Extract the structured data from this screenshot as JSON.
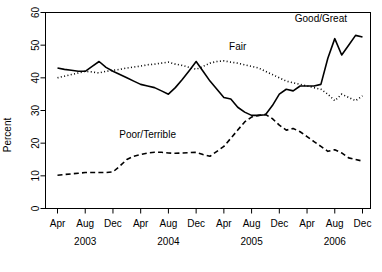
{
  "chart_data": {
    "type": "line",
    "title": "",
    "xlabel": "",
    "ylabel": "Percent",
    "ylim": [
      0,
      60
    ],
    "yticks": [
      0,
      10,
      20,
      30,
      40,
      50,
      60
    ],
    "ytick_labels": [
      "0",
      "10",
      "20",
      "30",
      "40",
      "50",
      "60"
    ],
    "grid": false,
    "legend_position": "inline-annotations",
    "x_tick_labels": [
      "Apr",
      "Aug",
      "Dec",
      "Apr",
      "Aug",
      "Dec",
      "Apr",
      "Aug",
      "Dec",
      "Apr",
      "Aug",
      "Dec"
    ],
    "x_year_labels": [
      "2003",
      "2004",
      "2005",
      "2006"
    ],
    "x_indices_of_ticks": [
      0,
      4,
      8,
      12,
      16,
      20,
      24,
      28,
      32,
      36,
      40,
      44
    ],
    "x": [
      "2003-04",
      "2003-05",
      "2003-06",
      "2003-07",
      "2003-08",
      "2003-09",
      "2003-10",
      "2003-11",
      "2003-12",
      "2004-01",
      "2004-02",
      "2004-03",
      "2004-04",
      "2004-05",
      "2004-06",
      "2004-07",
      "2004-08",
      "2004-09",
      "2004-10",
      "2004-11",
      "2004-12",
      "2005-01",
      "2005-02",
      "2005-03",
      "2005-04",
      "2005-05",
      "2005-06",
      "2005-07",
      "2005-08",
      "2005-09",
      "2005-10",
      "2005-11",
      "2005-12",
      "2006-01",
      "2006-02",
      "2006-03",
      "2006-04",
      "2006-05",
      "2006-06",
      "2006-07",
      "2006-08",
      "2006-09",
      "2006-10",
      "2006-11",
      "2006-12"
    ],
    "series": [
      {
        "name": "Good/Great",
        "style": "solid",
        "label": "Good/Great",
        "label_x_index": 38,
        "label_y_value": 57,
        "values": [
          43.0,
          42.6,
          42.3,
          42.0,
          42.0,
          43.5,
          45.0,
          43.2,
          42.0,
          41.0,
          40.0,
          39.0,
          38.0,
          37.5,
          37.0,
          36.0,
          35.0,
          37.0,
          39.5,
          42.2,
          45.0,
          42.0,
          39.0,
          36.5,
          34.0,
          33.5,
          31.0,
          29.5,
          28.5,
          28.5,
          28.7,
          31.5,
          35.0,
          36.5,
          36.0,
          37.5,
          37.5,
          37.5,
          38.0,
          46.0,
          52.0,
          47.0,
          50.0,
          53.0,
          52.5
        ]
      },
      {
        "name": "Fair",
        "style": "dotted",
        "label": "Fair",
        "label_x_index": 26,
        "label_y_value": 48.5,
        "values": [
          40.0,
          40.5,
          41.0,
          41.5,
          42.0,
          41.8,
          41.5,
          42.0,
          42.3,
          42.6,
          43.0,
          43.3,
          43.6,
          44.0,
          44.2,
          44.5,
          44.8,
          44.2,
          43.8,
          43.2,
          42.6,
          43.5,
          44.5,
          45.0,
          45.2,
          44.8,
          44.5,
          44.0,
          43.5,
          43.0,
          42.0,
          41.0,
          40.0,
          39.0,
          38.5,
          38.0,
          37.5,
          37.0,
          36.5,
          35.0,
          33.0,
          35.0,
          34.0,
          33.0,
          34.5
        ]
      },
      {
        "name": "Poor/Terrible",
        "style": "dashed",
        "label": "Poor/Terrible",
        "label_x_index": 13,
        "label_y_value": 21.5,
        "values": [
          10.2,
          10.4,
          10.6,
          10.8,
          11.0,
          11.0,
          11.0,
          11.0,
          11.2,
          13.0,
          15.0,
          16.0,
          16.5,
          17.0,
          17.2,
          17.2,
          17.0,
          16.9,
          17.0,
          17.1,
          17.2,
          16.5,
          16.0,
          17.5,
          19.0,
          21.5,
          24.0,
          26.5,
          28.0,
          28.5,
          28.8,
          27.5,
          25.5,
          24.0,
          24.5,
          23.5,
          22.0,
          20.5,
          19.0,
          17.5,
          18.0,
          17.0,
          15.5,
          15.0,
          14.5
        ]
      }
    ]
  }
}
